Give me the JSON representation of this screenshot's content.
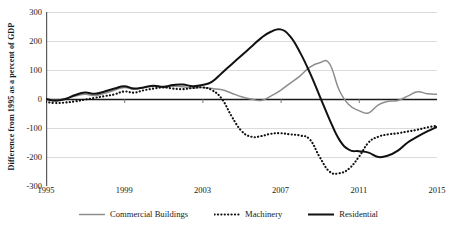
{
  "chart_data": {
    "type": "line",
    "title": "",
    "subtitle": "",
    "xlabel": "",
    "ylabel": "Difference from 1995 as a percent of GDP",
    "xlim": [
      1995,
      2015
    ],
    "ylim": [
      -300,
      300
    ],
    "xticks": [
      "1995",
      "1999",
      "2003",
      "2007",
      "2011",
      "2015"
    ],
    "xtick_values": [
      1995,
      1999,
      2003,
      2007,
      2011,
      2015
    ],
    "yticks": [
      "300",
      "200",
      "100",
      "0",
      "-100",
      "-200",
      "-300"
    ],
    "ytick_values": [
      300,
      200,
      100,
      0,
      -100,
      -200,
      -300
    ],
    "grid": true,
    "grid_axis": "y",
    "legend_position": "bottom",
    "x": [
      1995,
      1995.5,
      1996,
      1996.5,
      1997,
      1997.5,
      1998,
      1998.5,
      1999,
      1999.5,
      2000,
      2000.5,
      2001,
      2001.5,
      2002,
      2002.5,
      2003,
      2003.5,
      2004,
      2004.5,
      2005,
      2005.5,
      2006,
      2006.5,
      2007,
      2007.5,
      2008,
      2008.5,
      2009,
      2009.5,
      2010,
      2010.5,
      2011,
      2011.5,
      2012,
      2012.5,
      2013,
      2013.5,
      2014,
      2014.5,
      2015
    ],
    "series": [
      {
        "name": "Commercial Buildings",
        "color": "#8d8d8d",
        "style": "solid",
        "values": [
          0,
          -4,
          2,
          10,
          16,
          12,
          20,
          30,
          40,
          34,
          40,
          44,
          40,
          44,
          42,
          38,
          40,
          36,
          32,
          20,
          8,
          0,
          -5,
          10,
          30,
          55,
          80,
          110,
          125,
          122,
          30,
          -20,
          -40,
          -48,
          -20,
          -8,
          -5,
          10,
          25,
          18,
          16
        ]
      },
      {
        "name": "Machinery",
        "color": "#111111",
        "style": "dotted",
        "values": [
          -10,
          -14,
          -12,
          -8,
          -2,
          4,
          10,
          16,
          26,
          22,
          30,
          36,
          40,
          36,
          34,
          38,
          40,
          30,
          0,
          -60,
          -110,
          -130,
          -128,
          -120,
          -118,
          -122,
          -126,
          -140,
          -200,
          -250,
          -256,
          -240,
          -200,
          -150,
          -130,
          -122,
          -118,
          -112,
          -106,
          -98,
          -92
        ]
      },
      {
        "name": "Residential",
        "color": "#111111",
        "style": "solid",
        "values": [
          0,
          -6,
          0,
          14,
          22,
          18,
          26,
          36,
          44,
          36,
          40,
          46,
          42,
          48,
          50,
          44,
          48,
          60,
          90,
          120,
          150,
          180,
          210,
          232,
          240,
          215,
          160,
          90,
          10,
          -70,
          -140,
          -175,
          -180,
          -185,
          -200,
          -195,
          -178,
          -150,
          -130,
          -112,
          -96
        ]
      }
    ]
  },
  "axis": {
    "y_axis_title": "Difference from 1995 as a percent of GDP"
  },
  "legend": {
    "items": [
      {
        "label": "Commercial Buildings",
        "icon": "gray-solid-line-swatch"
      },
      {
        "label": "Machinery",
        "icon": "black-dotted-line-swatch"
      },
      {
        "label": "Residential",
        "icon": "black-solid-line-swatch"
      }
    ]
  }
}
